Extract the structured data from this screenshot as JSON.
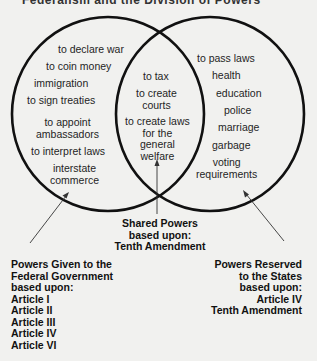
{
  "title_cutoff": "Federalism and the Division of Powers",
  "diagram": {
    "left_circle": {
      "label": "Federal Government",
      "items": [
        "to declare war",
        "to coin money",
        "immigration",
        "to sign treaties",
        "to appoint\nambassadors",
        "to interpret  laws",
        "interstate\ncommerce"
      ]
    },
    "overlap": {
      "items": [
        "to tax",
        "to create\ncourts",
        "to create laws\nfor the\ngeneral\nwelfare"
      ]
    },
    "right_circle": {
      "label": "States",
      "items": [
        "to pass laws",
        "health",
        "education",
        "police",
        "marriage",
        "garbage",
        "voting\nrequirements"
      ]
    },
    "captions": {
      "shared": [
        "Shared Powers",
        "based upon:",
        "Tenth Amendment"
      ],
      "federal": [
        "Powers Given to the",
        "Federal Government",
        "based upon:",
        "Article I",
        "Article II",
        "Article III",
        "Article IV",
        "Article VI"
      ],
      "states": [
        "Powers Reserved",
        "to the States",
        "based upon:",
        "Article IV",
        "Tenth Amendment"
      ]
    },
    "colors": {
      "background": "#f1f1ef",
      "stroke": "#111111",
      "text": "#1f1f1f"
    }
  }
}
